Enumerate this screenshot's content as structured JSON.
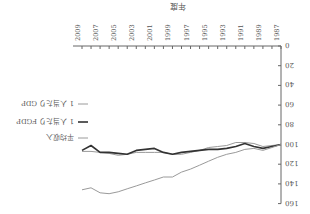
{
  "chart_data": {
    "type": "line",
    "title": "",
    "xlabel": "年度",
    "ylabel": "",
    "ylim": [
      0,
      160
    ],
    "yticks": [
      0,
      20,
      40,
      60,
      80,
      100,
      120,
      140,
      160
    ],
    "x": [
      1987,
      1988,
      1989,
      1990,
      1991,
      1992,
      1993,
      1994,
      1995,
      1996,
      1997,
      1998,
      1999,
      2000,
      2001,
      2002,
      2003,
      2004,
      2005,
      2006,
      2007,
      2008,
      2009
    ],
    "xtick_labels": [
      "1987",
      "1989",
      "1991",
      "1993",
      "1995",
      "1997",
      "1999",
      "2001",
      "2003",
      "2005",
      "2007",
      "2009"
    ],
    "grid": false,
    "legend_position": "right",
    "rotation_deg": 180,
    "series": [
      {
        "name": "1 人当たり GDP",
        "color": "#9a9a9a",
        "width": 1,
        "values": [
          100,
          101,
          102,
          99,
          98,
          98,
          101,
          102,
          103,
          106,
          108,
          110,
          110,
          108,
          108,
          108,
          108,
          110,
          111,
          109,
          108,
          107,
          107
        ]
      },
      {
        "name": "1 人当たり FGDP",
        "color": "#333333",
        "width": 1.6,
        "values": [
          100,
          102,
          104,
          102,
          99,
          102,
          104,
          105,
          105,
          106,
          107,
          108,
          110,
          108,
          104,
          105,
          106,
          110,
          109,
          108,
          108,
          101,
          106
        ]
      },
      {
        "name": "平均収入",
        "color": "#9a9a9a",
        "width": 1,
        "values": [
          100,
          103,
          106,
          104,
          105,
          108,
          110,
          113,
          117,
          121,
          125,
          128,
          133,
          133,
          136,
          139,
          142,
          145,
          148,
          150,
          149,
          144,
          146
        ]
      }
    ]
  }
}
